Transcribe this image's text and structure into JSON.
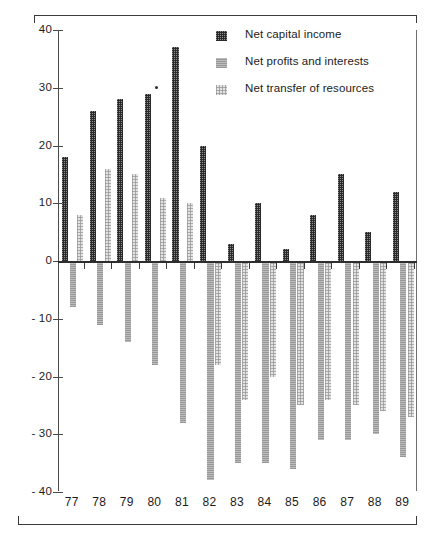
{
  "chart_data": {
    "type": "bar",
    "title": "",
    "xlabel": "",
    "ylabel": "",
    "ylim": [
      -40,
      40
    ],
    "yticks": [
      "40",
      "30",
      "20",
      "10",
      "0",
      "- 10",
      "- 20",
      "- 30",
      "- 40"
    ],
    "ytick_values": [
      40,
      30,
      20,
      10,
      0,
      -10,
      -20,
      -30,
      -40
    ],
    "grid": false,
    "legend_position": "top-right",
    "categories": [
      "77",
      "78",
      "79",
      "80",
      "81",
      "82",
      "83",
      "84",
      "85",
      "86",
      "87",
      "88",
      "89"
    ],
    "series": [
      {
        "name": "Net capital income",
        "swatch": "dark-checkered",
        "color": "#8e8e8e",
        "values": [
          18,
          26,
          28,
          29,
          37,
          20,
          3,
          10,
          2,
          8,
          15,
          5,
          12
        ]
      },
      {
        "name": "Net profits and interests",
        "swatch": "medium-gray",
        "color": "#bdbdbd",
        "values": [
          -8,
          -11,
          -14,
          -18,
          -28,
          -38,
          -35,
          -35,
          -36,
          -31,
          -31,
          -30,
          -34
        ]
      },
      {
        "name": "Net transfer of resources",
        "swatch": "light-dotted",
        "color": "#e3e3e3",
        "values": [
          8,
          16,
          15,
          11,
          10,
          -18,
          -24,
          -20,
          -25,
          -24,
          -25,
          -26,
          -27
        ]
      }
    ]
  },
  "legend": {
    "items": [
      {
        "label": "Net capital income"
      },
      {
        "label": "Net profits and interests"
      },
      {
        "label": "Net transfer of resources"
      }
    ]
  }
}
